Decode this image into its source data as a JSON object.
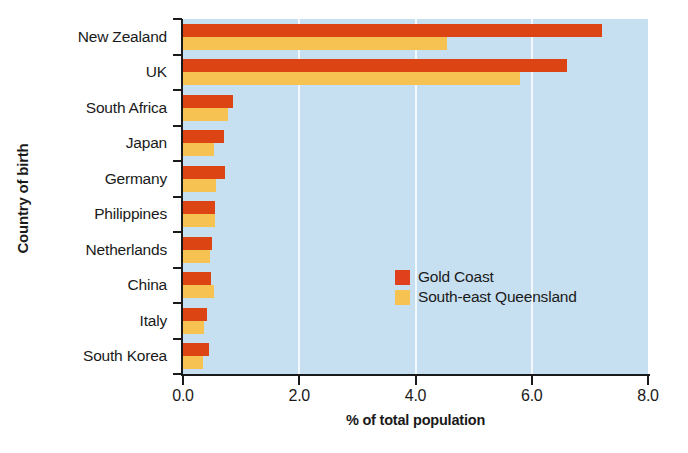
{
  "chart_data": {
    "type": "bar",
    "orientation": "horizontal",
    "title": "",
    "xlabel": "% of total population",
    "ylabel": "Country of birth",
    "xlim": [
      0.0,
      8.0
    ],
    "xticks": [
      "0.0",
      "2.0",
      "4.0",
      "6.0",
      "8.0"
    ],
    "xtick_values": [
      0.0,
      2.0,
      4.0,
      6.0,
      8.0
    ],
    "grid": "vertical-white",
    "legend_position": "inner-right",
    "categories": [
      "New Zealand",
      "UK",
      "South Africa",
      "Japan",
      "Germany",
      "Philippines",
      "Netherlands",
      "China",
      "Italy",
      "South Korea"
    ],
    "series": [
      {
        "name": "Gold Coast",
        "color": "#dc4413",
        "values": [
          7.2,
          6.6,
          0.86,
          0.7,
          0.72,
          0.55,
          0.5,
          0.48,
          0.41,
          0.45
        ]
      },
      {
        "name": "South-east Queensland",
        "color": "#f6c352",
        "values": [
          4.55,
          5.8,
          0.77,
          0.53,
          0.57,
          0.55,
          0.46,
          0.53,
          0.36,
          0.34
        ]
      }
    ],
    "plot_background": "#c7e0f1",
    "gridline_color": "#f2f8fc",
    "axis_color": "#1a1a1a"
  },
  "legend": {
    "items": [
      {
        "label": "Gold Coast",
        "swatch": "gold-coast"
      },
      {
        "label": "South-east Queensland",
        "swatch": "seq"
      }
    ]
  }
}
